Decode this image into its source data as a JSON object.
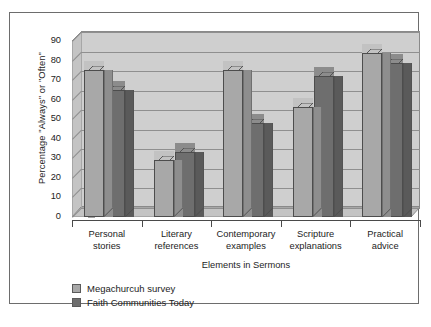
{
  "chart_data": {
    "type": "bar",
    "title": "",
    "subtitle": "",
    "xlabel": "Elements in Sermons",
    "ylabel": "Percentage \"Always\" or \"Often\"",
    "categories": [
      "Personal\nstories",
      "Literary\nreferences",
      "Contemporary\nexamples",
      "Scripture\nexplanations",
      "Practical\nadvice"
    ],
    "category_lines": [
      [
        "Personal",
        "stories"
      ],
      [
        "Literary",
        "references"
      ],
      [
        "Contemporary",
        "examples"
      ],
      [
        "Scripture",
        "explanations"
      ],
      [
        "Practical",
        "advice"
      ]
    ],
    "series": [
      {
        "name": "Megachurcuh survey",
        "color": "#a8a8a8",
        "values": [
          75,
          29,
          75,
          56,
          84
        ]
      },
      {
        "name": "Faith Communities Today",
        "color": "#6e6e6e",
        "values": [
          65,
          33,
          48,
          72,
          79
        ]
      }
    ],
    "ylim": [
      0,
      90
    ],
    "ytick_labels": [
      "90",
      "80",
      "70",
      "60",
      "50",
      "40",
      "30",
      "20",
      "10",
      "0"
    ],
    "ytick_values": [
      90,
      80,
      70,
      60,
      50,
      40,
      30,
      20,
      10,
      0
    ],
    "ytick_step": 10,
    "grid": "horizontal",
    "legend_position": "below-left",
    "style": "3d-column",
    "plot_background": "#cfcfcf",
    "frame_color": "#6d6d6d"
  }
}
